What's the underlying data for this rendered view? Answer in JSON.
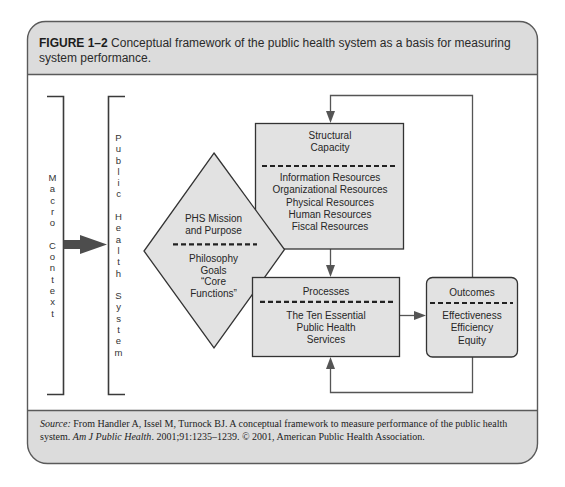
{
  "figure": {
    "label": "FIGURE 1–2",
    "title": "Conceptual framework of the public health system as a basis for measuring system performance."
  },
  "diagram": {
    "macro_context": {
      "label": "Macro Context"
    },
    "public_health_system": {
      "label": "Public Health System"
    },
    "mission": {
      "heading": [
        "PHS Mission",
        "and Purpose"
      ],
      "items": [
        "Philosophy",
        "Goals",
        "“Core",
        "Functions”"
      ]
    },
    "structural_capacity": {
      "heading": [
        "Structural",
        "Capacity"
      ],
      "items": [
        "Information Resources",
        "Organizational Resources",
        "Physical Resources",
        "Human Resources",
        "Fiscal Resources"
      ]
    },
    "processes": {
      "heading": [
        "Processes"
      ],
      "items": [
        "The Ten Essential",
        "Public Health",
        "Services"
      ]
    },
    "outcomes": {
      "heading": [
        "Outcomes"
      ],
      "items": [
        "Effectiveness",
        "Efficiency",
        "Equity"
      ]
    },
    "colors": {
      "header_fill": "#dcdcdc",
      "box_fill": "#e2e2e2",
      "box_stroke": "#333333",
      "connector": "#555555"
    }
  },
  "source": {
    "label": "Source:",
    "text_1": " From Handler A, Issel M, Turnock BJ. A conceptual framework to measure performance of the public health system. ",
    "journal": "Am J Public Health",
    "text_2": ". 2001;91:1235–1239. © 2001, American Public Health Association."
  }
}
